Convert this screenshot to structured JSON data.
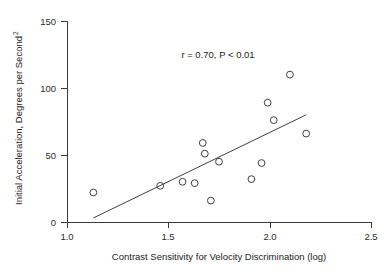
{
  "chart_data": {
    "type": "scatter",
    "title": "",
    "xlabel": "Contrast Sensitivity for Velocity Discrimination (log)",
    "ylabel_main": "Initial Acceleration, Degrees per Second",
    "ylabel_superscript": "2",
    "ylabel_full": "Initial Acceleration, Degrees per Second²",
    "xlim": [
      1.0,
      2.5
    ],
    "ylim": [
      0,
      150
    ],
    "xticks": [
      1.0,
      1.5,
      2.0,
      2.5
    ],
    "xtick_labels": [
      "1.0",
      "1.5",
      "2.0",
      "2.5"
    ],
    "yticks": [
      0,
      50,
      100,
      150
    ],
    "ytick_labels": [
      "0",
      "50",
      "100",
      "150"
    ],
    "grid": false,
    "legend": false,
    "annotations": [
      {
        "name": "correlation-statistics",
        "text": "r = 0.70, P < 0.01",
        "x": 1.76,
        "y": 123
      }
    ],
    "marker_style": "open-circle",
    "marker_color": "#404040",
    "line_color": "#404040",
    "points": [
      {
        "x": 1.13,
        "y": 22
      },
      {
        "x": 1.46,
        "y": 27
      },
      {
        "x": 1.57,
        "y": 30
      },
      {
        "x": 1.63,
        "y": 29
      },
      {
        "x": 1.67,
        "y": 59
      },
      {
        "x": 1.68,
        "y": 51
      },
      {
        "x": 1.71,
        "y": 16
      },
      {
        "x": 1.75,
        "y": 45
      },
      {
        "x": 1.91,
        "y": 32
      },
      {
        "x": 1.96,
        "y": 44
      },
      {
        "x": 1.99,
        "y": 89
      },
      {
        "x": 2.02,
        "y": 76
      },
      {
        "x": 2.1,
        "y": 110
      },
      {
        "x": 2.18,
        "y": 66
      }
    ],
    "fit_line": {
      "name": "regression-line",
      "x1": 1.13,
      "y1": 3,
      "x2": 2.18,
      "y2": 80
    }
  },
  "colors": {
    "axis": "#3a3a3a",
    "marker": "#404040",
    "text": "#1c1c1c",
    "background": "#ffffff"
  }
}
